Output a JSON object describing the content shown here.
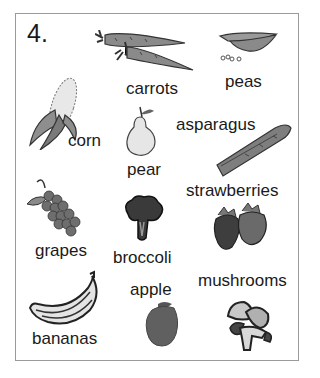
{
  "exercise": {
    "number": "4.",
    "items": [
      {
        "id": "carrots",
        "label": "carrots"
      },
      {
        "id": "peas",
        "label": "peas"
      },
      {
        "id": "corn",
        "label": "corn"
      },
      {
        "id": "pear",
        "label": "pear"
      },
      {
        "id": "asparagus",
        "label": "asparagus"
      },
      {
        "id": "strawberries",
        "label": "strawberries"
      },
      {
        "id": "grapes",
        "label": "grapes"
      },
      {
        "id": "broccoli",
        "label": "broccoli"
      },
      {
        "id": "apple",
        "label": "apple"
      },
      {
        "id": "mushrooms",
        "label": "mushrooms"
      },
      {
        "id": "bananas",
        "label": "bananas"
      }
    ]
  }
}
